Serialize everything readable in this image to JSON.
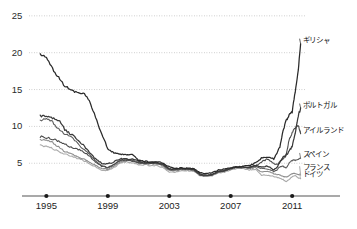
{
  "chart_data": {
    "type": "line",
    "title": "",
    "subtitle": "",
    "xlabel": "",
    "ylabel": "",
    "xlim": [
      1994.0,
      2011.9
    ],
    "ylim": [
      3.0,
      26.2
    ],
    "grid": true,
    "grid_axis": "y",
    "legend_position": "right-inline-labels",
    "x_ticks": [
      "1995",
      "1999",
      "2003",
      "2007",
      "2011"
    ],
    "x_tick_values": [
      1995,
      1999,
      2003,
      2007,
      2011
    ],
    "y_ticks": [
      "5",
      "10",
      "15",
      "20",
      "25"
    ],
    "y_tick_values": [
      5,
      10,
      15,
      20,
      25
    ],
    "series": [
      {
        "name": "ギリシャ",
        "color": "#2a2a2a",
        "label_x": 2011.55,
        "label_y": 21.9,
        "x": [
          1994.6,
          1995.0,
          1995.4,
          1995.8,
          1996.2,
          1996.6,
          1997.0,
          1997.4,
          1997.8,
          1998.2,
          1998.6,
          1999.0,
          1999.4,
          1999.8,
          2000.2,
          2000.6,
          2001.0,
          2001.4,
          2001.8,
          2002.2,
          2002.6,
          2003.0,
          2003.4,
          2003.8,
          2004.2,
          2004.6,
          2005.0,
          2005.4,
          2005.8,
          2006.2,
          2006.6,
          2007.0,
          2007.4,
          2007.8,
          2008.2,
          2008.6,
          2009.0,
          2009.4,
          2009.8,
          2010.0,
          2010.2,
          2010.4,
          2010.6,
          2010.8,
          2011.0,
          2011.2,
          2011.4,
          2011.55
        ],
        "y": [
          19.8,
          19.3,
          17.8,
          16.6,
          15.5,
          14.9,
          14.6,
          14.5,
          13.4,
          11.2,
          9.0,
          7.0,
          6.4,
          6.3,
          6.1,
          6.2,
          5.4,
          5.3,
          5.1,
          5.2,
          5.0,
          4.5,
          4.3,
          4.4,
          4.3,
          4.3,
          3.7,
          3.6,
          3.7,
          4.1,
          4.2,
          4.4,
          4.5,
          4.6,
          4.7,
          5.0,
          5.7,
          5.8,
          5.6,
          6.4,
          7.2,
          9.3,
          10.7,
          11.5,
          12.0,
          14.7,
          17.8,
          21.2
        ]
      },
      {
        "name": "ポルトガル",
        "color": "#3a3a3a",
        "label_x": 2011.55,
        "label_y": 13.1,
        "x": [
          1994.6,
          1995.0,
          1995.4,
          1995.8,
          1996.2,
          1996.6,
          1997.0,
          1997.4,
          1997.8,
          1998.2,
          1998.6,
          1999.0,
          1999.4,
          1999.8,
          2000.2,
          2000.6,
          2001.0,
          2001.4,
          2001.8,
          2002.2,
          2002.6,
          2003.0,
          2003.4,
          2003.8,
          2004.2,
          2004.6,
          2005.0,
          2005.4,
          2005.8,
          2006.2,
          2006.6,
          2007.0,
          2007.4,
          2007.8,
          2008.2,
          2008.6,
          2009.0,
          2009.4,
          2009.8,
          2010.0,
          2010.2,
          2010.4,
          2010.6,
          2010.8,
          2011.0,
          2011.2,
          2011.4,
          2011.55
        ],
        "y": [
          11.4,
          11.3,
          11.1,
          10.9,
          9.6,
          8.9,
          8.3,
          7.5,
          6.5,
          5.6,
          5.0,
          4.9,
          5.2,
          5.6,
          5.6,
          5.5,
          5.3,
          5.1,
          5.1,
          5.1,
          4.9,
          4.2,
          4.2,
          4.3,
          4.3,
          4.2,
          3.5,
          3.4,
          3.5,
          3.9,
          4.0,
          4.3,
          4.5,
          4.5,
          4.4,
          4.7,
          4.5,
          4.6,
          4.1,
          4.4,
          5.2,
          5.8,
          6.1,
          6.6,
          7.3,
          9.1,
          11.5,
          12.5
        ]
      },
      {
        "name": "アイルランド",
        "color": "#4b4b4b",
        "label_x": 2011.55,
        "label_y": 9.6,
        "x": [
          1994.6,
          1995.0,
          1995.4,
          1995.8,
          1996.2,
          1996.6,
          1997.0,
          1997.4,
          1997.8,
          1998.2,
          1998.6,
          1999.0,
          1999.4,
          1999.8,
          2000.2,
          2000.6,
          2001.0,
          2001.4,
          2001.8,
          2002.2,
          2002.6,
          2003.0,
          2003.4,
          2003.8,
          2004.2,
          2004.6,
          2005.0,
          2005.4,
          2005.8,
          2006.2,
          2006.6,
          2007.0,
          2007.4,
          2007.8,
          2008.2,
          2008.6,
          2009.0,
          2009.4,
          2009.8,
          2010.0,
          2010.2,
          2010.4,
          2010.6,
          2010.8,
          2011.0,
          2011.2,
          2011.4,
          2011.55
        ],
        "y": [
          8.6,
          8.5,
          8.3,
          8.0,
          7.6,
          7.2,
          6.9,
          6.6,
          6.0,
          5.2,
          4.6,
          4.4,
          4.8,
          5.4,
          5.4,
          5.3,
          5.1,
          5.0,
          5.0,
          5.0,
          4.8,
          4.2,
          4.2,
          4.3,
          4.2,
          4.1,
          3.4,
          3.3,
          3.4,
          3.9,
          4.0,
          4.3,
          4.5,
          4.5,
          4.4,
          4.6,
          5.2,
          5.6,
          5.0,
          4.8,
          5.2,
          5.6,
          6.0,
          8.2,
          9.1,
          9.8,
          10.2,
          9.0
        ]
      },
      {
        "name": "スペイン",
        "color": "#5e5e5e",
        "label_x": 2011.55,
        "label_y": 6.4,
        "x": [
          1994.6,
          1995.0,
          1995.4,
          1995.8,
          1996.2,
          1996.6,
          1997.0,
          1997.4,
          1997.8,
          1998.2,
          1998.6,
          1999.0,
          1999.4,
          1999.8,
          2000.2,
          2000.6,
          2001.0,
          2001.4,
          2001.8,
          2002.2,
          2002.6,
          2003.0,
          2003.4,
          2003.8,
          2004.2,
          2004.6,
          2005.0,
          2005.4,
          2005.8,
          2006.2,
          2006.6,
          2007.0,
          2007.4,
          2007.8,
          2008.2,
          2008.6,
          2009.0,
          2009.4,
          2009.8,
          2010.0,
          2010.2,
          2010.4,
          2010.6,
          2010.8,
          2011.0,
          2011.2,
          2011.4,
          2011.55
        ],
        "y": [
          10.8,
          11.0,
          10.6,
          9.6,
          9.0,
          8.6,
          7.8,
          6.9,
          6.2,
          5.3,
          4.7,
          4.4,
          4.8,
          5.4,
          5.5,
          5.4,
          5.1,
          5.0,
          5.0,
          5.0,
          4.8,
          4.1,
          4.1,
          4.2,
          4.2,
          4.1,
          3.4,
          3.3,
          3.4,
          3.8,
          4.0,
          4.3,
          4.5,
          4.4,
          4.4,
          4.6,
          4.3,
          4.2,
          3.9,
          4.1,
          4.5,
          4.6,
          4.3,
          5.0,
          5.4,
          5.4,
          5.6,
          5.7
        ]
      },
      {
        "name": "フランス",
        "color": "#8c8c8c",
        "label_x": 2011.55,
        "label_y": 4.6,
        "x": [
          1994.6,
          1995.0,
          1995.4,
          1995.8,
          1996.2,
          1996.6,
          1997.0,
          1997.4,
          1997.8,
          1998.2,
          1998.6,
          1999.0,
          1999.4,
          1999.8,
          2000.2,
          2000.6,
          2001.0,
          2001.4,
          2001.8,
          2002.2,
          2002.6,
          2003.0,
          2003.4,
          2003.8,
          2004.2,
          2004.6,
          2005.0,
          2005.4,
          2005.8,
          2006.2,
          2006.6,
          2007.0,
          2007.4,
          2007.8,
          2008.2,
          2008.6,
          2009.0,
          2009.4,
          2009.8,
          2010.0,
          2010.2,
          2010.4,
          2010.6,
          2010.8,
          2011.0,
          2011.2,
          2011.4,
          2011.55
        ],
        "y": [
          8.2,
          8.1,
          7.8,
          7.2,
          6.6,
          6.3,
          5.9,
          5.6,
          5.1,
          4.7,
          4.3,
          4.2,
          4.6,
          5.2,
          5.4,
          5.3,
          5.0,
          5.0,
          4.9,
          4.9,
          4.6,
          4.0,
          4.0,
          4.2,
          4.1,
          4.0,
          3.4,
          3.3,
          3.4,
          3.8,
          3.9,
          4.2,
          4.4,
          4.4,
          4.3,
          4.4,
          3.8,
          3.9,
          3.6,
          3.5,
          3.4,
          3.2,
          3.1,
          3.3,
          3.6,
          3.6,
          3.5,
          3.4
        ]
      },
      {
        "name": "ドイツ",
        "color": "#ababab",
        "label_x": 2011.55,
        "label_y": 3.65,
        "x": [
          1994.6,
          1995.0,
          1995.4,
          1995.8,
          1996.2,
          1996.6,
          1997.0,
          1997.4,
          1997.8,
          1998.2,
          1998.6,
          1999.0,
          1999.4,
          1999.8,
          2000.2,
          2000.6,
          2001.0,
          2001.4,
          2001.8,
          2002.2,
          2002.6,
          2003.0,
          2003.4,
          2003.8,
          2004.2,
          2004.6,
          2005.0,
          2005.4,
          2005.8,
          2006.2,
          2006.6,
          2007.0,
          2007.4,
          2007.8,
          2008.2,
          2008.6,
          2009.0,
          2009.4,
          2009.8,
          2010.0,
          2010.2,
          2010.4,
          2010.6,
          2010.8,
          2011.0,
          2011.2,
          2011.4,
          2011.55
        ],
        "y": [
          7.4,
          7.3,
          7.0,
          6.6,
          6.2,
          6.0,
          5.7,
          5.4,
          4.9,
          4.5,
          4.1,
          4.0,
          4.4,
          5.0,
          5.2,
          5.1,
          4.8,
          4.8,
          4.7,
          4.7,
          4.4,
          3.8,
          3.8,
          4.0,
          4.0,
          3.9,
          3.3,
          3.2,
          3.3,
          3.7,
          3.8,
          4.1,
          4.3,
          4.3,
          4.1,
          4.2,
          3.4,
          3.4,
          3.2,
          3.1,
          3.0,
          2.8,
          2.5,
          2.8,
          3.2,
          3.3,
          3.0,
          2.9
        ]
      }
    ]
  },
  "axis": {
    "x_axis_line_color": "#555555",
    "tick_dot_color": "#1a1a1a",
    "gridline_color": "#bdbdbd"
  }
}
